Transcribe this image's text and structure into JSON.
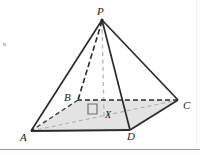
{
  "figure": {
    "type": "geometry-diagram",
    "labels": {
      "apex": "P",
      "base_back_left": "B",
      "base_back_right": "C",
      "base_front_left": "A",
      "base_front_right": "D",
      "base_centre": "X"
    },
    "vertices": [
      {
        "name": "P",
        "label": "P",
        "x": 102,
        "y": 19
      },
      {
        "name": "B",
        "label": "B",
        "x": 78,
        "y": 100
      },
      {
        "name": "C",
        "label": "C",
        "x": 178,
        "y": 100
      },
      {
        "name": "A",
        "label": "A",
        "x": 31,
        "y": 131
      },
      {
        "name": "D",
        "label": "D",
        "x": 130,
        "y": 130
      },
      {
        "name": "X",
        "label": "X",
        "x": 104,
        "y": 115
      }
    ],
    "edges": [
      {
        "name": "edge-PA",
        "from": "P",
        "to": "A",
        "style": "solid"
      },
      {
        "name": "edge-PD",
        "from": "P",
        "to": "D",
        "style": "solid"
      },
      {
        "name": "edge-PC",
        "from": "P",
        "to": "C",
        "style": "solid"
      },
      {
        "name": "edge-PB",
        "from": "P",
        "to": "B",
        "style": "dashed"
      },
      {
        "name": "edge-AD",
        "from": "A",
        "to": "D",
        "style": "solid"
      },
      {
        "name": "edge-DC",
        "from": "D",
        "to": "C",
        "style": "solid"
      },
      {
        "name": "edge-CB",
        "from": "C",
        "to": "B",
        "style": "dashed"
      },
      {
        "name": "edge-BA",
        "from": "B",
        "to": "A",
        "style": "dashed"
      },
      {
        "name": "diagonal-AC",
        "from": "A",
        "to": "C",
        "style": "dashed-light"
      },
      {
        "name": "altitude-PX",
        "from": "P",
        "to": "X",
        "style": "dashed-light"
      }
    ],
    "right_angle_marker": {
      "name": "right-angle-marker-at-X",
      "at": "X",
      "note": "square marker indicating PX perpendicular to base"
    },
    "base_face": {
      "name": "base-face-ABCD",
      "fill": "#e3e3e3"
    },
    "colors": {
      "stroke": "#2b2b2b",
      "light_stroke": "#b4b4b4",
      "base_fill": "#e3e3e3",
      "rule": "#9a9a9a",
      "background": "#ffffff"
    }
  }
}
